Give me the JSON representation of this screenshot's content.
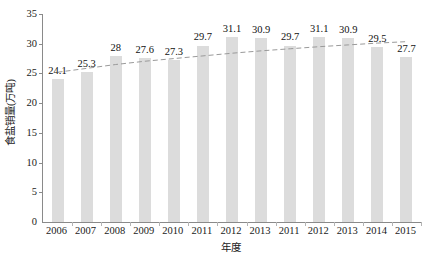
{
  "chart_data": {
    "type": "bar",
    "title": "",
    "xlabel": "年度",
    "ylabel": "食盐销量(万吨)",
    "categories": [
      "2006",
      "2007",
      "2008",
      "2009",
      "2010",
      "2011",
      "2012",
      "2013",
      "2011",
      "2012",
      "2013",
      "2014",
      "2015"
    ],
    "values": [
      24.1,
      25.3,
      28,
      27.6,
      27.3,
      29.7,
      31.1,
      30.9,
      29.7,
      31.1,
      30.9,
      29.5,
      27.7
    ],
    "value_labels": [
      "24.1",
      "25.3",
      "28",
      "27.6",
      "27.3",
      "29.7",
      "31.1",
      "30.9",
      "29.7",
      "31.1",
      "30.9",
      "29.5",
      "27.7"
    ],
    "ylim": [
      0,
      35
    ],
    "ytick_step": 5,
    "ytick_labels": [
      "0",
      "5",
      "10",
      "15",
      "20",
      "25",
      "30",
      "35"
    ],
    "grid": false,
    "legend": "none",
    "series": [
      {
        "name": "食盐销量",
        "type": "bar",
        "color": "#dcdcdc",
        "values": [
          24.1,
          25.3,
          28,
          27.6,
          27.3,
          29.7,
          31.1,
          30.9,
          29.7,
          31.1,
          30.9,
          29.5,
          27.7
        ]
      },
      {
        "name": "趋势线",
        "type": "line",
        "style": "dashed",
        "color": "#9a9a9a",
        "values": [
          25.2,
          25.85,
          26.5,
          27.05,
          27.5,
          27.95,
          28.4,
          28.8,
          29.15,
          29.5,
          29.8,
          30.1,
          30.35
        ]
      }
    ]
  },
  "axes": {
    "y_title": "食盐销量(万吨)",
    "x_title": "年度"
  }
}
